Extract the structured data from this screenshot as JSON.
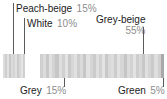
{
  "chart_data": {
    "type": "bar",
    "title": "",
    "subtitle": "",
    "xlabel": "",
    "ylabel": "",
    "orientation": "horizontal",
    "stacked": true,
    "grid": false,
    "legend_position": "callouts",
    "categories": [
      "Peach-beige",
      "White",
      "Grey-beige",
      "Grey",
      "Green"
    ],
    "values": [
      15,
      10,
      55,
      15,
      5
    ],
    "value_suffix": "%",
    "series": [
      {
        "name": "Colour distribution",
        "values": [
          15,
          10,
          55,
          15,
          5
        ]
      }
    ],
    "annotations": [
      {
        "label": "Peach-beige",
        "value": "15%",
        "position": "above-left"
      },
      {
        "label": "White",
        "value": "10%",
        "position": "above-left"
      },
      {
        "label": "Grey-beige",
        "value": "55%",
        "position": "above-right"
      },
      {
        "label": "Grey",
        "value": "15%",
        "position": "below-left"
      },
      {
        "label": "Green",
        "value": "5%",
        "position": "below-right"
      }
    ]
  },
  "callouts": {
    "peach_beige": {
      "name": "Peach-beige",
      "pct": "15%"
    },
    "white": {
      "name": "White",
      "pct": "10%"
    },
    "grey_beige": {
      "name": "Grey-beige",
      "pct": "55%"
    },
    "grey": {
      "name": "Grey",
      "pct": "15%"
    },
    "green": {
      "name": "Green",
      "pct": "5%"
    }
  },
  "colors": {
    "label_text": "#1c1c1c",
    "percent_text": "#8d8d8d",
    "leader_line": "#5a5a5a",
    "background": "#ffffff",
    "stripe_light": "#e3e3e3",
    "stripe_mid": "#d2d2d2",
    "stripe_dark": "#bdbdbd"
  },
  "bar": {
    "left_segment_stripes": [
      "#dcdcdc",
      "#cfcfcf",
      "#e2e2e2",
      "#c9c9c9",
      "#dadada",
      "#d4d4d4",
      "#e0e0e0",
      "#cbcbcb",
      "#d8d8d8",
      "#e4e4e4",
      "#d0d0d0"
    ],
    "right_segment_stripes": [
      "#cfcfcf",
      "#dcdcdc",
      "#c8c8c8",
      "#e1e1e1",
      "#d3d3d3",
      "#c6c6c6",
      "#dedede",
      "#d0d0d0",
      "#e3e3e3",
      "#cacaca",
      "#d7d7d7",
      "#e0e0e0",
      "#cdcdcd",
      "#dadada",
      "#c7c7c7",
      "#e2e2e2",
      "#d5d5d5",
      "#cbcbcb",
      "#dfdfdf",
      "#d1d1d1",
      "#e4e4e4",
      "#c9c9c9",
      "#d9d9d9",
      "#dddddd",
      "#cccccc",
      "#e1e1e1",
      "#d6d6d6",
      "#c5c5c5",
      "#dbdbdb",
      "#d2d2d2",
      "#e3e3e3",
      "#cecece",
      "#d8d8d8",
      "#c8c8c8",
      "#e0e0e0",
      "#d4d4d4",
      "#cacaca",
      "#dedede",
      "#d0d0d0",
      "#a9a9a9"
    ]
  }
}
